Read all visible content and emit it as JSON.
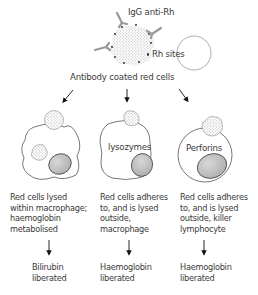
{
  "top": {
    "antibody_label": "IgG anti-Rh",
    "sites_label": "Rh sites",
    "coated_cells_label": "Antibody coated red cells"
  },
  "columns": [
    {
      "inner_label": "",
      "description": "Red cells lysed\nwithin macrophage;\nhaemoglobin\nmetabolised",
      "outcome": "Bilirubin\nliberated"
    },
    {
      "inner_label": "lysozymes",
      "description": "Red cells adheres\nto, and is lysed\noutside,\nmacrophage",
      "outcome": "Haemoglobin\nliberated"
    },
    {
      "inner_label": "Perforins",
      "description": "Red cells adheres\nto, and is lysed\noutside, killer\nlymphocyte",
      "outcome": "Haemoglobin\nliberated"
    }
  ],
  "colors": {
    "outline": "#555555",
    "antibody": "#9a9a9a",
    "nucleus": "#bdbdbd",
    "red_cell_dots": "#b8b8b8"
  }
}
